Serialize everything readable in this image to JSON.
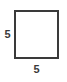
{
  "figure": {
    "type": "square",
    "stroke_color": "#3a3a3a",
    "fill_color": "#ffffff",
    "background_color": "#ffffff"
  },
  "labels": {
    "left_side": "5",
    "bottom_side": "5"
  },
  "chart_data": {
    "type": "diagram",
    "shape": "square",
    "side_length": 5,
    "labeled_sides": [
      {
        "position": "left",
        "value": "5"
      },
      {
        "position": "bottom",
        "value": "5"
      }
    ],
    "title": "",
    "units": ""
  }
}
